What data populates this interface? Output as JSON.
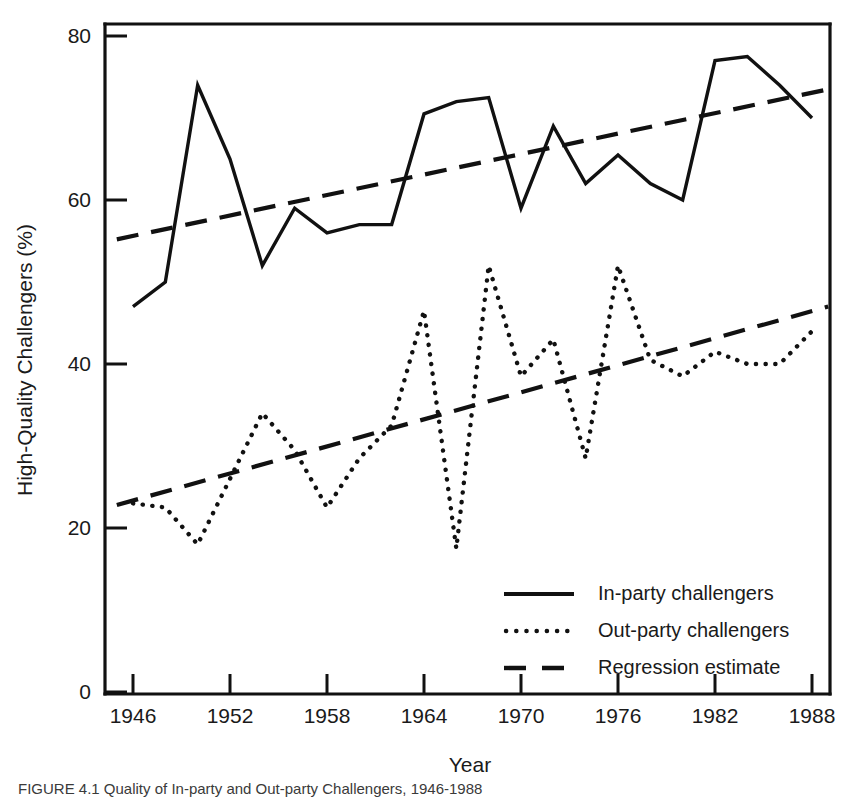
{
  "figure": {
    "caption": "FIGURE 4.1  Quality of In-party and Out-party Challengers, 1946-1988"
  },
  "chart_data": {
    "type": "line",
    "title": "",
    "xlabel": "Year",
    "ylabel": "High-Quality Challengers (%)",
    "xlim": [
      1944,
      1990
    ],
    "ylim": [
      0,
      83
    ],
    "xticks": [
      1946,
      1952,
      1958,
      1964,
      1970,
      1976,
      1982,
      1988
    ],
    "xtick_labels": [
      "1946",
      "1952",
      "1958",
      "1964",
      "1970",
      "1976",
      "1982",
      "1988"
    ],
    "yticks": [
      0,
      20,
      40,
      60,
      80
    ],
    "ytick_labels": [
      "0",
      "20",
      "40",
      "60",
      "80"
    ],
    "grid": false,
    "legend_position": "lower right",
    "x": [
      1946,
      1948,
      1950,
      1952,
      1954,
      1956,
      1958,
      1960,
      1962,
      1964,
      1966,
      1968,
      1970,
      1972,
      1974,
      1976,
      1978,
      1980,
      1982,
      1984,
      1986,
      1988
    ],
    "series": [
      {
        "name": "In-party challengers",
        "style": "solid",
        "values": [
          47,
          50,
          74,
          65,
          52,
          59,
          56,
          57,
          57,
          70.5,
          72,
          72.5,
          59,
          69,
          62,
          65.5,
          62,
          60,
          77,
          77.5,
          74,
          70
        ]
      },
      {
        "name": "Out-party challengers",
        "style": "dotted",
        "values": [
          23,
          22.5,
          18,
          26,
          34,
          29.5,
          22.5,
          28.5,
          32.5,
          46.5,
          17.5,
          52,
          38.5,
          43,
          28.5,
          52,
          40.5,
          38.5,
          41.5,
          40,
          40,
          44
        ]
      },
      {
        "name": "Regression estimate",
        "style": "dashed",
        "in_party_endpoints": [
          [
            1945,
            55.2
          ],
          [
            1989,
            73.5
          ]
        ],
        "out_party_endpoints": [
          [
            1945,
            22.8
          ],
          [
            1989,
            47.0
          ]
        ]
      }
    ],
    "legend_entries": [
      {
        "label": "In-party challengers",
        "style": "solid"
      },
      {
        "label": "Out-party challengers",
        "style": "dotted"
      },
      {
        "label": "Regression estimate",
        "style": "dashed"
      }
    ]
  }
}
